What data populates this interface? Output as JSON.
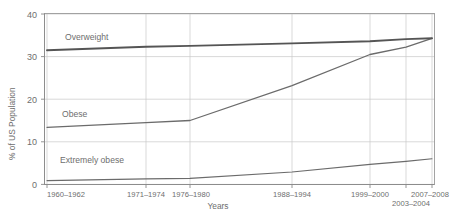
{
  "chart_data": {
    "type": "line",
    "title": "",
    "xlabel": "Years",
    "ylabel": "% of US Population",
    "ylim": [
      0,
      40
    ],
    "yticks": [
      0,
      10,
      20,
      30,
      40
    ],
    "ytick_labels": [
      "0",
      "10",
      "20",
      "30",
      "40"
    ],
    "grid": true,
    "legend": "inline-labels",
    "categories": [
      "1960–1962",
      "1971–1974",
      "1976–1980",
      "1988–1994",
      "1999–2000",
      "2003–2004",
      "2007–2008"
    ],
    "series": [
      {
        "name": "Overweight",
        "color": "#555555",
        "values": [
          31.5,
          32.3,
          32.5,
          33.1,
          33.6,
          34.1,
          34.3
        ]
      },
      {
        "name": "Obese",
        "color": "#6b6b6b",
        "values": [
          13.4,
          14.5,
          15.0,
          23.2,
          30.5,
          32.2,
          34.3
        ]
      },
      {
        "name": "Extremely obese",
        "color": "#6b6b6b",
        "values": [
          0.9,
          1.3,
          1.4,
          2.9,
          4.7,
          5.4,
          6.0
        ]
      }
    ]
  },
  "axis": {
    "y_title": "% of US Population",
    "x_title": "Years",
    "y_tick_0": "0",
    "y_tick_10": "10",
    "y_tick_20": "20",
    "y_tick_30": "30",
    "y_tick_40": "40",
    "x_tick_1": "1960–1962",
    "x_tick_2": "1971–1974",
    "x_tick_3": "1976–1980",
    "x_tick_4": "1988–1994",
    "x_tick_5": "1999–2000",
    "x_tick_6": "2003–2004",
    "x_tick_7": "2007–2008"
  },
  "series_labels": {
    "overweight": "Overweight",
    "obese": "Obese",
    "extremely_obese": "Extremely obese"
  },
  "colors": {
    "overweight_line": "#555555",
    "obese_line": "#6b6b6b",
    "extremely_obese_line": "#6b6b6b",
    "grid": "#c8c8c8",
    "axis": "#8a8a8a",
    "text": "#6e6e6e",
    "background": "#ffffff"
  }
}
